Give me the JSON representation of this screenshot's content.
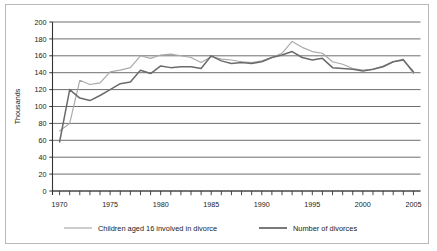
{
  "chart_data": {
    "type": "line",
    "title": "",
    "xlabel": "",
    "ylabel": "Thousands",
    "xlim": [
      1969.3,
      2005.7
    ],
    "ylim": [
      0,
      200
    ],
    "grid": "horizontal",
    "legend_position": "bottom",
    "ytick_labels": [
      "0",
      "20",
      "40",
      "60",
      "80",
      "100",
      "120",
      "140",
      "160",
      "180",
      "200"
    ],
    "ytick_values": [
      0,
      20,
      40,
      60,
      80,
      100,
      120,
      140,
      160,
      180,
      200
    ],
    "xtick_labels": [
      "1970",
      "1975",
      "1980",
      "1985",
      "1990",
      "1995",
      "2000",
      "2005"
    ],
    "xtick_values": [
      1970,
      1975,
      1980,
      1985,
      1990,
      1995,
      2000,
      2005
    ],
    "x_minor_ticks": [
      1970,
      1971,
      1972,
      1973,
      1974,
      1975,
      1976,
      1977,
      1978,
      1979,
      1980,
      1981,
      1982,
      1983,
      1984,
      1985,
      1986,
      1987,
      1988,
      1989,
      1990,
      1991,
      1992,
      1993,
      1994,
      1995,
      1996,
      1997,
      1998,
      1999,
      2000,
      2001,
      2002,
      2003,
      2004,
      2005
    ],
    "x": [
      1970,
      1971,
      1972,
      1973,
      1974,
      1975,
      1976,
      1977,
      1978,
      1979,
      1980,
      1981,
      1982,
      1983,
      1984,
      1985,
      1986,
      1987,
      1988,
      1989,
      1990,
      1991,
      1992,
      1993,
      1994,
      1995,
      1996,
      1997,
      1998,
      1999,
      2000,
      2001,
      2002,
      2003,
      2004,
      2005
    ],
    "series": [
      {
        "name": "Children aged 16 involved in divorce",
        "color": "#a8a8a8",
        "values": [
          71,
          80,
          131,
          126,
          128,
          141,
          143,
          146,
          160,
          157,
          161,
          162,
          160,
          158,
          152,
          159,
          156,
          155,
          153,
          152,
          154,
          158,
          163,
          177,
          170,
          165,
          163,
          153,
          150,
          145,
          143,
          144,
          148,
          153,
          156,
          139
        ]
      },
      {
        "name": "Number of divorces",
        "color": "#6b6b6b",
        "values": [
          58,
          120,
          110,
          107,
          113,
          120,
          127,
          129,
          143,
          139,
          148,
          146,
          147,
          147,
          145,
          160,
          154,
          151,
          152,
          151,
          153,
          158,
          161,
          165,
          158,
          155,
          157,
          146,
          145,
          144,
          142,
          144,
          147,
          153,
          155,
          141
        ]
      }
    ]
  },
  "legend": {
    "items": [
      {
        "label": "Children aged 16 involved in divorce",
        "color": "#a8a8a8"
      },
      {
        "label": "Number of divorces",
        "color": "#6b6b6b"
      }
    ]
  },
  "colors": {
    "grid": "#5d5d5d",
    "axis": "#333333",
    "frame": "#b9b9b9",
    "text": "#1a1a1a",
    "series_light": "#a8a8a8",
    "series_dark": "#6b6b6b"
  }
}
